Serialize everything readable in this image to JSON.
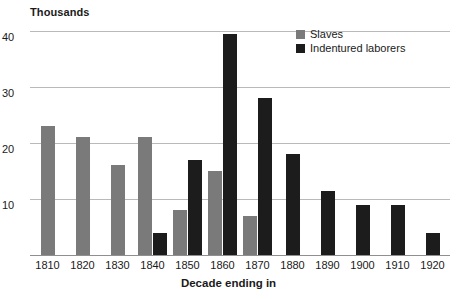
{
  "chart_data": {
    "type": "bar",
    "title": "",
    "subtitle": "",
    "xlabel": "Decade ending in",
    "ylabel": "Thousands",
    "ylim": [
      0,
      40
    ],
    "yticks": [
      10,
      20,
      30,
      40
    ],
    "ytick_labels": [
      "10",
      "20",
      "30",
      "40"
    ],
    "grid": true,
    "legend_position": "top-right",
    "categories": [
      "1810",
      "1820",
      "1830",
      "1840",
      "1850",
      "1860",
      "1870",
      "1880",
      "1890",
      "1900",
      "1910",
      "1920"
    ],
    "series": [
      {
        "name": "Slaves",
        "color": "#7a7a7a",
        "values": [
          23,
          21,
          16,
          21,
          8,
          15,
          7,
          0,
          0,
          0,
          0,
          0
        ]
      },
      {
        "name": "Indentured laborers",
        "color": "#1c1c1c",
        "values": [
          0,
          0,
          0,
          4,
          17,
          39.5,
          28,
          18,
          11.5,
          9,
          9,
          4
        ]
      }
    ]
  },
  "axes": {
    "unit_caption": "Thousands",
    "x_title": "Decade ending in"
  },
  "legend": {
    "items": [
      {
        "label": "Slaves",
        "color": "#7a7a7a"
      },
      {
        "label": "Indentured laborers",
        "color": "#1c1c1c"
      }
    ]
  },
  "colors": {
    "slaves": "#7a7a7a",
    "indentured": "#1c1c1c",
    "gridline": "#b9b9b9",
    "axis": "#8f8f8f",
    "text": "#1a1a1a",
    "background": "#ffffff"
  }
}
